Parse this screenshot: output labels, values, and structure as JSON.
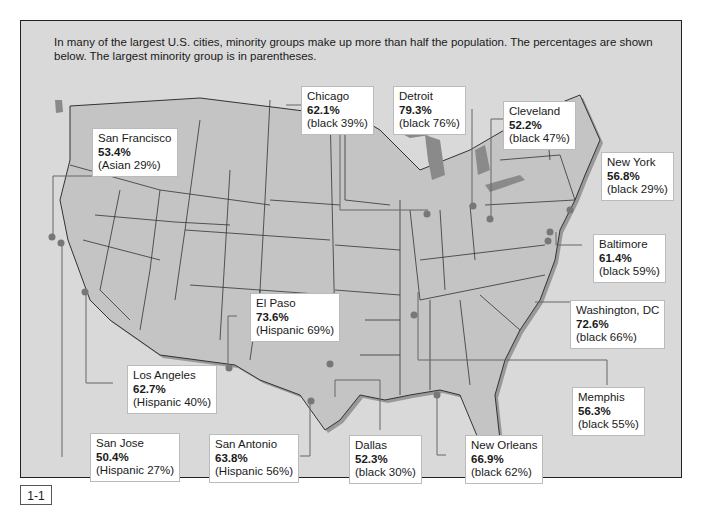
{
  "intro_text": "In many of the largest U.S. cities, minority groups make up more than half the population. The percentages are shown below. The largest minority group is in parentheses.",
  "figure_label": "1-1",
  "colors": {
    "background": "#d9d9d9",
    "land": "#c4c4c4",
    "border": "#333333",
    "callout_bg": "#ffffff",
    "dot": "#777777",
    "shadow": "#888888"
  },
  "cities": [
    {
      "name": "San Francisco",
      "percent": "53.4%",
      "group": "(Asian 29%)"
    },
    {
      "name": "Chicago",
      "percent": "62.1%",
      "group": "(black 39%)"
    },
    {
      "name": "Detroit",
      "percent": "79.3%",
      "group": "(black 76%)"
    },
    {
      "name": "Cleveland",
      "percent": "52.2%",
      "group": "(black 47%)"
    },
    {
      "name": "New York",
      "percent": "56.8%",
      "group": "(black 29%)"
    },
    {
      "name": "Baltimore",
      "percent": "61.4%",
      "group": "(black 59%)"
    },
    {
      "name": "Washington, DC",
      "percent": "72.6%",
      "group": "(black 66%)"
    },
    {
      "name": "El Paso",
      "percent": "73.6%",
      "group": "(Hispanic 69%)"
    },
    {
      "name": "Los Angeles",
      "percent": "62.7%",
      "group": "(Hispanic 40%)"
    },
    {
      "name": "Memphis",
      "percent": "56.3%",
      "group": "(black 55%)"
    },
    {
      "name": "San Jose",
      "percent": "50.4%",
      "group": "(Hispanic 27%)"
    },
    {
      "name": "San Antonio",
      "percent": "63.8%",
      "group": "(Hispanic 56%)"
    },
    {
      "name": "Dallas",
      "percent": "52.3%",
      "group": "(black 30%)"
    },
    {
      "name": "New Orleans",
      "percent": "66.9%",
      "group": "(black 62%)"
    }
  ]
}
